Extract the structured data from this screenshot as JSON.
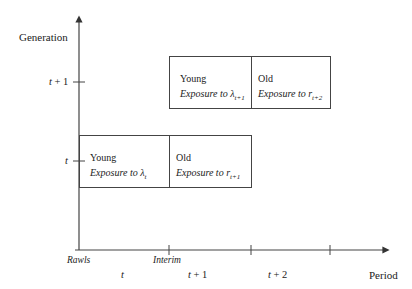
{
  "axes": {
    "y_label": "Generation",
    "x_label": "Period",
    "y_ticks": [
      {
        "label_var": "t",
        "label_suffix": " + 1"
      },
      {
        "label_var": "t",
        "label_suffix": ""
      }
    ],
    "x_tick_labels": {
      "rawls": "Rawls",
      "interim": "Interim"
    },
    "x_period_labels": [
      {
        "var": "t",
        "suffix": ""
      },
      {
        "var": "t",
        "suffix": " + 1"
      },
      {
        "var": "t",
        "suffix": " + 2"
      }
    ]
  },
  "generations": [
    {
      "name": "generation-t+1",
      "young": {
        "title": "Young",
        "exposure": "Exposure  to λ",
        "sub": "t+1"
      },
      "old": {
        "title": "Old",
        "exposure": "Exposure  to r",
        "sub": "t+2"
      }
    },
    {
      "name": "generation-t",
      "young": {
        "title": "Young",
        "exposure": "Exposure to λ",
        "sub": "t"
      },
      "old": {
        "title": "Old",
        "exposure": "Exposure  to r",
        "sub": "t+1"
      }
    }
  ],
  "colors": {
    "line": "#444444",
    "text": "#222222"
  }
}
